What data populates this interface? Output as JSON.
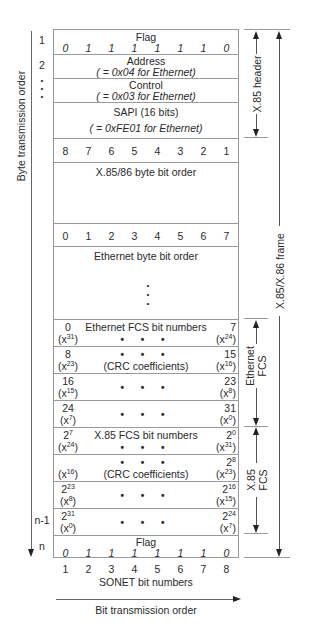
{
  "left_axis": {
    "label": "Byte transmission order"
  },
  "row_numbers": [
    "1",
    "2",
    "•",
    "•",
    "•",
    "n-1",
    "n"
  ],
  "header": {
    "flag_title": "Flag",
    "flag_bits": [
      "0",
      "1",
      "1",
      "1",
      "1",
      "1",
      "1",
      "0"
    ],
    "address_title": "Address",
    "address_note": "( = 0x04 for Ethernet)",
    "control_title": "Control",
    "control_note": "( = 0x03 for Ethernet)",
    "sapi_title": "SAPI (16 bits)",
    "sapi_note": "( = 0xFE01 for Ethernet)"
  },
  "x85_bit_order": {
    "bits": [
      "8",
      "7",
      "6",
      "5",
      "4",
      "3",
      "2",
      "1"
    ],
    "label": "X.85/86 byte bit order"
  },
  "ethernet_bit_order": {
    "bits": [
      "0",
      "1",
      "2",
      "3",
      "4",
      "5",
      "6",
      "7"
    ],
    "label": "Ethernet byte bit order"
  },
  "continuation_dots": "•",
  "ethernet_fcs": {
    "title": "Ethernet FCS bit numbers",
    "coeff_label": "(CRC coefficients)",
    "dots": "• • •",
    "rows": [
      {
        "left_num": "0",
        "left_exp": "31",
        "right_num": "7",
        "right_exp": "24"
      },
      {
        "left_num": "8",
        "left_exp": "23",
        "right_num": "15",
        "right_exp": "16"
      },
      {
        "left_num": "16",
        "left_exp": "15",
        "right_num": "23",
        "right_exp": "8"
      },
      {
        "left_num": "24",
        "left_exp": "7",
        "right_num": "31",
        "right_exp": "0"
      }
    ]
  },
  "x85_fcs": {
    "title": "X.85 FCS bit numbers",
    "coeff_label": "(CRC coefficients)",
    "dots": "• • •",
    "rows": [
      {
        "left_base": "2",
        "left_pow": "7",
        "left_exp": "24",
        "right_base": "2",
        "right_pow": "0",
        "right_exp": "31"
      },
      {
        "left_base": "",
        "left_pow": "",
        "left_exp": "16",
        "right_base": "2",
        "right_pow": "8",
        "right_exp": "23"
      },
      {
        "left_base": "2",
        "left_pow": "23",
        "left_exp": "8",
        "right_base": "2",
        "right_pow": "16",
        "right_exp": "15"
      },
      {
        "left_base": "2",
        "left_pow": "31",
        "left_exp": "0",
        "right_base": "2",
        "right_pow": "24",
        "right_exp": "7"
      }
    ]
  },
  "closing_flag": {
    "title": "Flag",
    "bits": [
      "0",
      "1",
      "1",
      "1",
      "1",
      "1",
      "1",
      "0"
    ]
  },
  "sonet": {
    "bits": [
      "1",
      "2",
      "3",
      "4",
      "5",
      "6",
      "7",
      "8"
    ],
    "label": "SONET bit numbers"
  },
  "bottom_axis": {
    "label": "Bit transmission order"
  },
  "right_labels": {
    "x85_header": "X.85 header",
    "x85_frame": "X.85/X.86 frame",
    "ethernet_fcs_line1": "Ethernet",
    "ethernet_fcs_line2": "FCS",
    "x85_fcs_line1": "X.85",
    "x85_fcs_line2": "FCS"
  },
  "x": "x"
}
